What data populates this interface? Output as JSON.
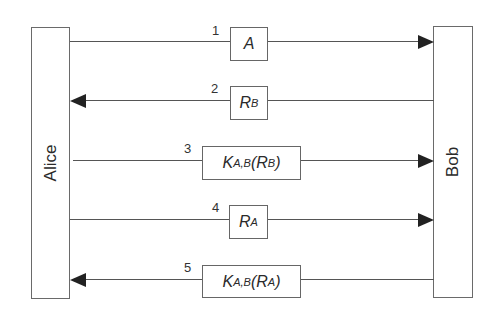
{
  "diagram": {
    "type": "sequence",
    "parties": {
      "left": "Alice",
      "right": "Bob"
    },
    "messages": [
      {
        "number": "1",
        "direction": "Alice→Bob",
        "content_base": "A",
        "content_sub": "",
        "content_suffix": ""
      },
      {
        "number": "2",
        "direction": "Bob→Alice",
        "content_base": "R",
        "content_sub": "B",
        "content_suffix": ""
      },
      {
        "number": "3",
        "direction": "Alice→Bob",
        "content_base": "K",
        "content_sub": "A,B",
        "content_arg_base": "R",
        "content_arg_sub": "B"
      },
      {
        "number": "4",
        "direction": "Alice→Bob",
        "content_base": "R",
        "content_sub": "A",
        "content_suffix": ""
      },
      {
        "number": "5",
        "direction": "Bob→Alice",
        "content_base": "K",
        "content_sub": "A,B",
        "content_arg_base": "R",
        "content_arg_sub": "A"
      }
    ]
  }
}
